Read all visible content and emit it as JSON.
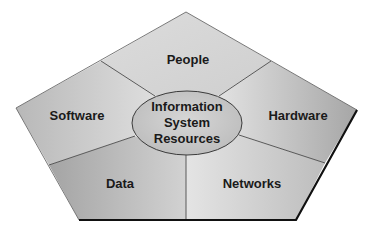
{
  "diagram": {
    "title": "Information System Resources",
    "center": {
      "line1": "Information",
      "line2": "System",
      "line3": "Resources"
    },
    "segments": [
      {
        "id": "people",
        "label": "People"
      },
      {
        "id": "hardware",
        "label": "Hardware"
      },
      {
        "id": "networks",
        "label": "Networks"
      },
      {
        "id": "data",
        "label": "Data"
      },
      {
        "id": "software",
        "label": "Software"
      }
    ],
    "colors": {
      "fill_light": "#d9d9d9",
      "fill_mid": "#c4c4c4",
      "fill_dark": "#a8a8a8",
      "edge": "#555555",
      "shadow_edge": "#111111",
      "ellipse_fill": "#c8c8c8"
    }
  }
}
